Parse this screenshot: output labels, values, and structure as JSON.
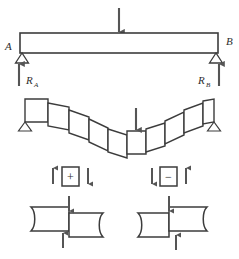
{
  "figure": {
    "stroke_color": "#3c3c3c",
    "arrow_color": "#555555",
    "fill_color": "#ffffff",
    "background": "#ffffff"
  },
  "beam": {
    "support_a_label": "A",
    "support_b_label": "B",
    "reaction_a_label": "R",
    "reaction_a_sub": "A",
    "reaction_b_label": "R",
    "reaction_b_sub": "B",
    "load_arrow_name": "downward-point-load",
    "support_a_type": "pin-support-triangle",
    "support_b_type": "pin-support-triangle"
  },
  "deflected": {
    "caption": "",
    "element_count": 12,
    "load_arrow_name": "downward-point-load",
    "support_left": "pin-support-triangle",
    "support_right": "pin-support-triangle"
  },
  "sign_convention": {
    "positive": {
      "symbol": "+",
      "left_arrow": "up",
      "right_arrow": "down"
    },
    "negative": {
      "symbol": "−",
      "left_arrow": "down",
      "right_arrow": "up"
    }
  },
  "deformation": {
    "positive_block": {
      "top_arrow": "down",
      "bottom_arrow": "up",
      "left_segment": "raised",
      "right_segment": "lowered"
    },
    "negative_block": {
      "top_arrow": "down",
      "bottom_arrow": "up",
      "left_segment": "lowered",
      "right_segment": "raised"
    }
  }
}
